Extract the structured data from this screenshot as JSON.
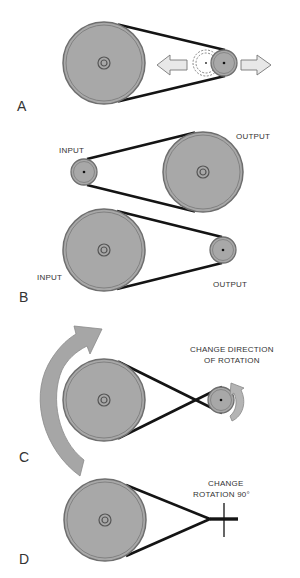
{
  "diagram": {
    "colors": {
      "pulley_fill": "#a8a8a8",
      "pulley_rim": "#6e6e6e",
      "belt": "#141414",
      "arrow_fill": "#a6a6a6",
      "arrow_light_fill": "#e6e6e6",
      "text": "#333333"
    },
    "panels": [
      {
        "id": "A",
        "label": "A",
        "description": "Adjustable center distance (tensioning)",
        "pulleys": [
          {
            "cx": 104,
            "cy": 63,
            "r": 41,
            "hub": "double-ring"
          },
          {
            "cx": 225,
            "cy": 63,
            "r": 13,
            "hub": "dot"
          }
        ],
        "ghost_pulley": {
          "cx": 205,
          "cy": 63,
          "r": 13
        },
        "arrows": [
          {
            "direction": "left",
            "x": 155,
            "y": 63
          },
          {
            "direction": "right",
            "x": 240,
            "y": 63
          }
        ]
      },
      {
        "id": "B",
        "label": "B",
        "description": "Speed change by pulley ratio",
        "drives": [
          {
            "pulleys": [
              {
                "cx": 84,
                "cy": 172,
                "r": 13,
                "hub": "dot",
                "role": "INPUT"
              },
              {
                "cx": 203,
                "cy": 172,
                "r": 40,
                "hub": "double-ring",
                "role": "OUTPUT"
              }
            ],
            "labels": {
              "input": "INPUT",
              "output": "OUTPUT"
            }
          },
          {
            "pulleys": [
              {
                "cx": 104,
                "cy": 250,
                "r": 41,
                "hub": "double-ring",
                "role": "INPUT"
              },
              {
                "cx": 223,
                "cy": 250,
                "r": 13,
                "hub": "dot",
                "role": "OUTPUT"
              }
            ],
            "labels": {
              "input": "INPUT",
              "output": "OUTPUT"
            }
          }
        ]
      },
      {
        "id": "C",
        "label": "C",
        "caption_line1": "CHANGE DIRECTION",
        "caption_line2": "OF ROTATION",
        "belt": "crossed",
        "pulleys": [
          {
            "cx": 104,
            "cy": 400,
            "r": 41,
            "hub": "double-ring"
          },
          {
            "cx": 220,
            "cy": 400,
            "r": 13,
            "hub": "dot"
          }
        ],
        "rotation_arrows": [
          {
            "size": "large",
            "direction": "clockwise"
          },
          {
            "size": "small",
            "direction": "counter-clockwise"
          }
        ]
      },
      {
        "id": "D",
        "label": "D",
        "caption_line1": "CHANGE",
        "caption_line2": "ROTATION 90°",
        "pulleys": [
          {
            "cx": 105,
            "cy": 520,
            "r": 41,
            "hub": "double-ring"
          }
        ],
        "shaft": {
          "x": 224,
          "y1": 502,
          "y2": 537
        }
      }
    ]
  }
}
